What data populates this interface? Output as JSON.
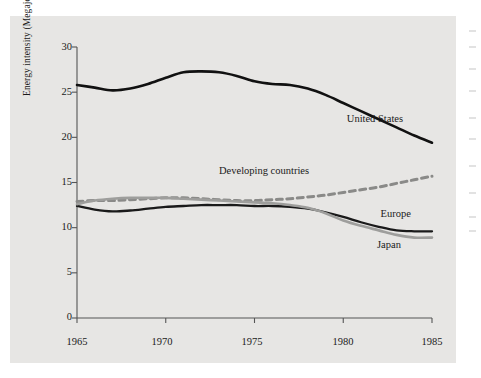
{
  "chart_data": {
    "type": "line",
    "title": "",
    "subtitle": "",
    "xlabel": "",
    "ylabel": "Energy intensity (Megajoules per dollar)",
    "xlim": [
      1965,
      1985
    ],
    "ylim": [
      0,
      30
    ],
    "yticks": [
      0,
      5,
      10,
      15,
      20,
      25,
      30
    ],
    "xticks": [
      1965,
      1970,
      1975,
      1980,
      1985
    ],
    "ytick_labels": [
      "0",
      "5",
      "10",
      "15",
      "20",
      "25",
      "30"
    ],
    "xtick_labels": [
      "1965",
      "1970",
      "1975",
      "1980",
      "1985"
    ],
    "grid": false,
    "legend_position": "inline-annotations",
    "x": [
      1965,
      1966,
      1967,
      1968,
      1969,
      1970,
      1971,
      1972,
      1973,
      1974,
      1975,
      1976,
      1977,
      1978,
      1979,
      1980,
      1981,
      1982,
      1983,
      1984,
      1985
    ],
    "series": [
      {
        "name": "United States",
        "style": "solid",
        "color": "#111111",
        "width": 2.6,
        "values": [
          25.8,
          25.5,
          25.2,
          25.4,
          25.9,
          26.6,
          27.2,
          27.3,
          27.2,
          26.8,
          26.2,
          25.9,
          25.8,
          25.4,
          24.7,
          23.8,
          22.9,
          22.0,
          21.1,
          20.2,
          19.4
        ]
      },
      {
        "name": "Developing countries",
        "style": "dashed",
        "color": "#8a8a88",
        "width": 3.0,
        "values": [
          12.9,
          13.0,
          13.0,
          13.1,
          13.2,
          13.3,
          13.3,
          13.2,
          13.1,
          13.0,
          13.0,
          13.1,
          13.2,
          13.4,
          13.6,
          13.9,
          14.2,
          14.5,
          14.9,
          15.3,
          15.7
        ]
      },
      {
        "name": "Europe",
        "style": "solid",
        "color": "#1a1a1a",
        "width": 2.3,
        "values": [
          12.4,
          12.0,
          11.8,
          11.9,
          12.1,
          12.3,
          12.4,
          12.5,
          12.5,
          12.5,
          12.4,
          12.4,
          12.3,
          12.1,
          11.7,
          11.2,
          10.6,
          10.1,
          9.7,
          9.6,
          9.6
        ]
      },
      {
        "name": "Japan",
        "style": "solid",
        "color": "#9e9e9c",
        "width": 2.6,
        "values": [
          12.6,
          13.0,
          13.2,
          13.3,
          13.3,
          13.3,
          13.2,
          13.1,
          13.0,
          12.9,
          12.8,
          12.7,
          12.5,
          12.2,
          11.6,
          10.8,
          10.2,
          9.7,
          9.2,
          8.9,
          8.9
        ]
      }
    ],
    "annotations": [
      {
        "text": "United States",
        "x": 1980.2,
        "y": 21.9
      },
      {
        "text": "Developing countries",
        "x": 1973.0,
        "y": 16.2
      },
      {
        "text": "Europe",
        "x": 1982.1,
        "y": 11.4
      },
      {
        "text": "Japan",
        "x": 1981.9,
        "y": 8.0
      }
    ]
  }
}
